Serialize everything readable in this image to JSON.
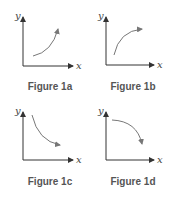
{
  "figures": [
    {
      "id": "1a",
      "caption": "Figure 1a",
      "x_label": "x",
      "y_label": "y",
      "curve": "increasing, concave up"
    },
    {
      "id": "1b",
      "caption": "Figure 1b",
      "x_label": "x",
      "y_label": "y",
      "curve": "increasing, concave down"
    },
    {
      "id": "1c",
      "caption": "Figure 1c",
      "x_label": "x",
      "y_label": "y",
      "curve": "decreasing, concave up"
    },
    {
      "id": "1d",
      "caption": "Figure 1d",
      "x_label": "x",
      "y_label": "y",
      "curve": "decreasing, concave down"
    }
  ],
  "colors": {
    "axis": "#333333",
    "curve": "#777777",
    "caption": "#555555"
  }
}
